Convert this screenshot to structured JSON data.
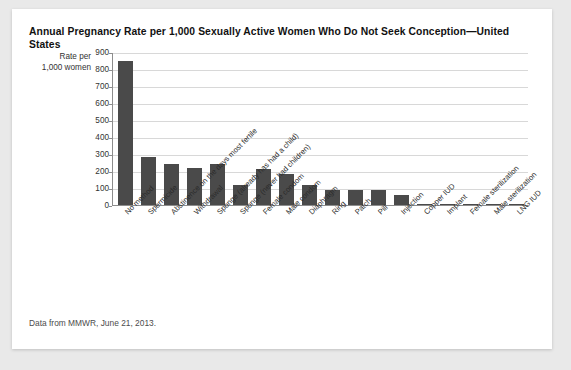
{
  "card": {
    "title": "Annual Pregnancy Rate per 1,000 Sexually Active Women Who Do Not Seek Conception—United States",
    "footnote": "Data from MMWR, June 21, 2013.",
    "y_axis_title_line1": "Rate per",
    "y_axis_title_line2": "1,000 women",
    "bar_color": "#4a4a4a",
    "grid_color": "#d8d8d8",
    "axis_color": "#8d8d8d",
    "card_background": "#ffffff",
    "page_background": "#e9e9e9"
  },
  "chart_data": {
    "type": "bar",
    "title": "Annual Pregnancy Rate per 1,000 Sexually Active Women Who Do Not Seek Conception—United States",
    "xlabel": "",
    "ylabel": "Rate per 1,000 women",
    "ylim": [
      0,
      900
    ],
    "yticks": [
      0,
      100,
      200,
      300,
      400,
      500,
      600,
      700,
      800,
      900
    ],
    "ytick_labels": [
      "0",
      "100",
      "200",
      "300",
      "400",
      "500",
      "600",
      "700",
      "800",
      "900"
    ],
    "grid": true,
    "legend": false,
    "categories": [
      "No method",
      "Spermicide",
      "Abstinence on the days most fertile",
      "Withdrawal",
      "Sponge (already has had a child)",
      "Sponge (never had children)",
      "Female condom",
      "Male condom",
      "Diaphragm",
      "Ring",
      "Patch",
      "Pill",
      "Injection",
      "Copper IUD",
      "Implant",
      "Female sterilization",
      "Male sterilization",
      "LNG IUD"
    ],
    "values": [
      850,
      280,
      240,
      220,
      240,
      120,
      210,
      180,
      120,
      90,
      90,
      90,
      60,
      8,
      5,
      5,
      1.5,
      0.2
    ]
  }
}
